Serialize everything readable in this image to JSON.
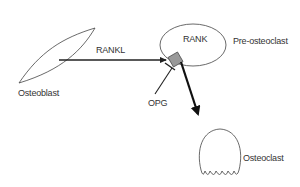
{
  "diagram": {
    "type": "signaling-pathway",
    "colors": {
      "line": "#222222",
      "outline": "#444444",
      "receptor_fill": "#999999",
      "text": "#333333",
      "background": "#ffffff"
    },
    "nodes": {
      "osteoblast": {
        "label": "Osteoblast",
        "shape": "lens"
      },
      "pre_osteoclast": {
        "label": "Pre-osteoclast",
        "shape": "ellipse",
        "inner_label": "RANK"
      },
      "osteoclast": {
        "label": "Osteoclast",
        "shape": "dome-with-scalloped-base"
      },
      "receptor": {
        "label": "RANK receptor",
        "shape": "gray-diamond"
      }
    },
    "edges": [
      {
        "from": "Osteoblast",
        "to": "RANK",
        "label": "RANKL",
        "type": "activation-arrow"
      },
      {
        "from": "OPG",
        "to": "RANK",
        "label": "OPG",
        "type": "inhibition-tbar"
      },
      {
        "from": "Pre-osteoclast",
        "to": "Osteoclast",
        "label": "",
        "type": "differentiation-arrow-thick"
      }
    ],
    "labels": {
      "osteoblast": "Osteoblast",
      "rankl": "RANKL",
      "rank": "RANK",
      "pre_osteoclast": "Pre-osteoclast",
      "opg": "OPG",
      "osteoclast": "Osteoclast"
    }
  }
}
